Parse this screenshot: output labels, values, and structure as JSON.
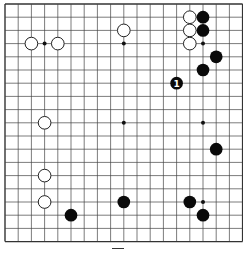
{
  "board": {
    "size": 19,
    "origin_x": 5,
    "origin_y": 4,
    "spacing": 13.2,
    "line_color": "#444444",
    "border_color": "#333333",
    "star_points": [
      [
        3,
        3
      ],
      [
        9,
        3
      ],
      [
        15,
        3
      ],
      [
        3,
        9
      ],
      [
        9,
        9
      ],
      [
        15,
        9
      ],
      [
        3,
        15
      ],
      [
        9,
        15
      ],
      [
        15,
        15
      ]
    ]
  },
  "stones": {
    "white": [
      [
        2,
        3
      ],
      [
        4,
        3
      ],
      [
        9,
        2
      ],
      [
        14,
        1
      ],
      [
        14,
        2
      ],
      [
        14,
        3
      ],
      [
        3,
        9
      ],
      [
        3,
        13
      ],
      [
        3,
        15
      ]
    ],
    "black": [
      [
        15,
        1
      ],
      [
        15,
        2
      ],
      [
        16,
        4
      ],
      [
        15,
        5
      ],
      [
        13,
        6
      ],
      [
        16,
        11
      ],
      [
        5,
        16
      ],
      [
        9,
        15
      ],
      [
        14,
        15
      ],
      [
        15,
        16
      ]
    ]
  },
  "labels": [
    {
      "col": 13,
      "row": 6,
      "text": "1",
      "color": "#ffffff"
    }
  ],
  "caption": {
    "text": "图"
  }
}
